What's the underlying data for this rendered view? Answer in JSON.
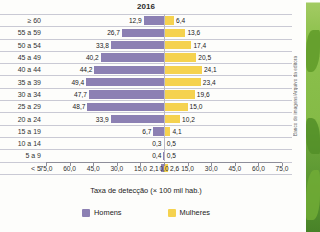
{
  "credit": "Banco de imagens/Arquivo da editora",
  "chart_data": {
    "type": "bar",
    "subtype": "population-pyramid",
    "title": "2016",
    "xlabel": "Taxa de detecção (× 100 mil hab.)",
    "ylabel": "",
    "categories": [
      "≥ 60",
      "55 a 59",
      "50 a 54",
      "45 a 49",
      "40 a 44",
      "35 a 39",
      "30 a 34",
      "25 a 29",
      "20 a 24",
      "15 a 19",
      "10 a 14",
      "5 a 9",
      "< 5"
    ],
    "series": [
      {
        "name": "Homens",
        "color": "#8c80b3",
        "side": "left",
        "values": [
          12.9,
          26.7,
          33.8,
          40.2,
          44.2,
          49.4,
          47.7,
          48.7,
          33.9,
          6.7,
          0.3,
          0.4,
          2.1
        ],
        "labels": [
          "12,9",
          "26,7",
          "33,8",
          "40,2",
          "44,2",
          "49,4",
          "47,7",
          "48,7",
          "33,9",
          "6,7",
          "0,3",
          "0,4",
          "2,1"
        ]
      },
      {
        "name": "Mulheres",
        "color": "#f5d24f",
        "side": "right",
        "values": [
          6.4,
          13.6,
          17.4,
          20.5,
          24.1,
          23.4,
          19.6,
          15.0,
          10.2,
          4.1,
          0.5,
          0.5,
          2.6
        ],
        "labels": [
          "6,4",
          "13,6",
          "17,4",
          "20,5",
          "24,1",
          "23,4",
          "19,6",
          "15,0",
          "10,2",
          "4,1",
          "0,5",
          "0,5",
          "2,6"
        ]
      }
    ],
    "xlim": [
      75.0,
      0.0,
      75.0
    ],
    "xticks": [
      "75,0",
      "60,0",
      "45,0",
      "30,0",
      "15,0",
      "0,0",
      "15,0",
      "30,0",
      "45,0",
      "60,0",
      "75,0"
    ],
    "xtick_values": [
      -75,
      -60,
      -45,
      -30,
      -15,
      0,
      15,
      30,
      45,
      60,
      75
    ],
    "grid": "horizontal-row-separators",
    "legend": {
      "position": "bottom",
      "entries": [
        {
          "label": "Homens",
          "color": "#8c80b3"
        },
        {
          "label": "Mulheres",
          "color": "#f5d24f"
        }
      ]
    }
  }
}
